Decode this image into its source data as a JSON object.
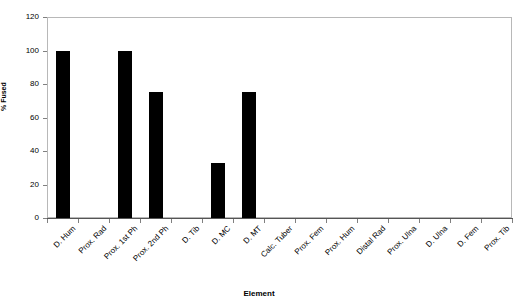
{
  "chart_data": {
    "type": "bar",
    "title": "",
    "xlabel": "Element",
    "ylabel": "% Fused",
    "categories": [
      "D. Hum",
      "Prox. Rad",
      "Prox. 1st Ph",
      "Prox. 2nd Ph",
      "D. Tib",
      "D. MC",
      "D. MT",
      "Calc. Tuber",
      "Prox. Fem",
      "Prox. Hum",
      "Distal Rad",
      "Prox. Ulna",
      "D. Ulna",
      "D. Fem",
      "Prox. Tib"
    ],
    "values": [
      100,
      0,
      100,
      75,
      0,
      33,
      75,
      0,
      0,
      0,
      0,
      0,
      0,
      0,
      0
    ],
    "ylim": [
      0,
      120
    ],
    "yticks": [
      0,
      20,
      40,
      60,
      80,
      100,
      120
    ],
    "ytick_labels": [
      "0",
      "20",
      "40",
      "60",
      "80",
      "100",
      "120"
    ],
    "grid": false,
    "legend": null,
    "bar_color": "#000000",
    "frame_color": "#b8b8b8",
    "background": "#ffffff"
  }
}
